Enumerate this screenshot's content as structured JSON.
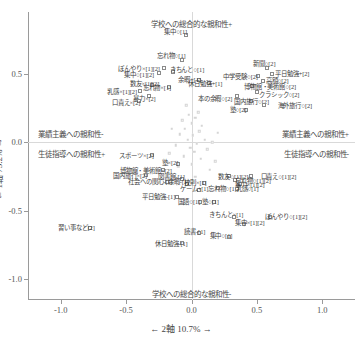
{
  "chart_data": {
    "type": "scatter",
    "title": "",
    "xlabel": "← 2軸 10.7% →",
    "ylabel": "← 1軸 75.2% →",
    "xlim": [
      -1.25,
      1.25
    ],
    "ylim": [
      -1.15,
      0.95
    ],
    "xticks": [
      "-1.0",
      "-0.5",
      "0.0",
      "0.5",
      "1.0"
    ],
    "xtickvals": [
      -1.0,
      -0.5,
      0.0,
      0.5,
      1.0
    ],
    "yticks": [
      "0.5",
      "0.0",
      "-0.5",
      "-1.0"
    ],
    "ytickvals": [
      0.5,
      0.0,
      -0.5,
      -1.0
    ],
    "grid": false,
    "legend": "none",
    "annotations": {
      "top": "学校への総合的な親和性+",
      "bottom": "学校への総合的な親和性-",
      "left_upper": "業績主義への親和性-",
      "left_lower": "生徒指導への親和性+",
      "right_upper": "業績主義への親和性+",
      "right_lower": "生徒指導への親和性-"
    },
    "points": [
      {
        "label": "集中○[1]",
        "x": -0.04,
        "y": 0.78,
        "lx": -0.12,
        "ly": 0.815
      },
      {
        "label": "忘れ物○[1]",
        "x": -0.07,
        "y": 0.6,
        "lx": -0.155,
        "ly": 0.635
      },
      {
        "label": "ぼんやり×[1][2]",
        "x": -0.21,
        "y": 0.545,
        "lx": -0.4,
        "ly": 0.545
      },
      {
        "label": "きちんと○[1]",
        "x": -0.145,
        "y": 0.515,
        "lx": -0.035,
        "ly": 0.535
      },
      {
        "label": "集中○[1][2]",
        "x": -0.245,
        "y": 0.505,
        "lx": -0.4,
        "ly": 0.5
      },
      {
        "label": "余暇+[1]",
        "x": 0.06,
        "y": 0.455,
        "lx": -0.015,
        "ly": 0.465
      },
      {
        "label": "休日勉強+[1]",
        "x": 0.13,
        "y": 0.43,
        "lx": 0.105,
        "ly": 0.43
      },
      {
        "label": "数友×[1][2]",
        "x": -0.3,
        "y": 0.42,
        "lx": -0.36,
        "ly": 0.435
      },
      {
        "label": "忘れ物×[1]",
        "x": -0.175,
        "y": 0.4,
        "lx": -0.265,
        "ly": 0.4
      },
      {
        "label": "乳感×[1][2]",
        "x": -0.39,
        "y": 0.375,
        "lx": -0.53,
        "ly": 0.375
      },
      {
        "label": "暴力×[2]",
        "x": -0.325,
        "y": 0.335,
        "lx": -0.36,
        "ly": 0.325
      },
      {
        "label": "口責え×[2]",
        "x": -0.4,
        "y": 0.3,
        "lx": -0.5,
        "ly": 0.295
      },
      {
        "label": "新聞○[2]",
        "x": 0.575,
        "y": 0.545,
        "lx": 0.555,
        "ly": 0.575
      },
      {
        "label": "平日勉強+[2]",
        "x": 0.615,
        "y": 0.5,
        "lx": 0.77,
        "ly": 0.505
      },
      {
        "label": "中学受験○[2]",
        "x": 0.505,
        "y": 0.48,
        "lx": 0.375,
        "ly": 0.485
      },
      {
        "label": "高額○[2]",
        "x": 0.545,
        "y": 0.445,
        "lx": 0.655,
        "ly": 0.455
      },
      {
        "label": "博物館・美術館○[2]",
        "x": 0.46,
        "y": 0.41,
        "lx": 0.6,
        "ly": 0.41
      },
      {
        "label": "クラシック○[2]",
        "x": 0.5,
        "y": 0.365,
        "lx": 0.67,
        "ly": 0.355
      },
      {
        "label": "本の余暇○[2]",
        "x": 0.345,
        "y": 0.34,
        "lx": 0.18,
        "ly": 0.325
      },
      {
        "label": "国内旅行○[2]",
        "x": 0.455,
        "y": 0.3,
        "lx": 0.46,
        "ly": 0.3
      },
      {
        "label": "海外旅行○[2]",
        "x": 0.555,
        "y": 0.275,
        "lx": 0.79,
        "ly": 0.275
      },
      {
        "label": "塾○[2]",
        "x": 0.42,
        "y": 0.235,
        "lx": 0.355,
        "ly": 0.245
      },
      {
        "label": "スポーツ×[2]",
        "x": -0.305,
        "y": -0.09,
        "lx": -0.42,
        "ly": -0.095
      },
      {
        "label": "塾×[2]",
        "x": -0.105,
        "y": -0.155,
        "lx": -0.165,
        "ly": -0.145
      },
      {
        "label": "博物館・美術館×[2]",
        "x": -0.215,
        "y": -0.2,
        "lx": -0.35,
        "ly": -0.2
      },
      {
        "label": "国内旅行×[2]",
        "x": -0.345,
        "y": -0.235,
        "lx": -0.47,
        "ly": -0.235
      },
      {
        "label": "図書館-[1]",
        "x": -0.075,
        "y": -0.265,
        "lx": -0.155,
        "ly": -0.245
      },
      {
        "label": "社会への関心-[1]",
        "x": -0.185,
        "y": -0.29,
        "lx": -0.315,
        "ly": -0.285
      },
      {
        "label": "余暇-[1]",
        "x": -0.035,
        "y": -0.305,
        "lx": -0.1,
        "ly": -0.285
      },
      {
        "label": "校則×[1]",
        "x": 0.095,
        "y": -0.3,
        "lx": 0.03,
        "ly": -0.29
      },
      {
        "label": "数友○[1][2]",
        "x": 0.285,
        "y": -0.245,
        "lx": 0.32,
        "ly": -0.245
      },
      {
        "label": "口責え○[1][2]",
        "x": 0.455,
        "y": -0.245,
        "lx": 0.665,
        "ly": -0.245
      },
      {
        "label": "忘れ物○[1][2]",
        "x": 0.335,
        "y": -0.275,
        "lx": 0.47,
        "ly": -0.275
      },
      {
        "label": "暴力×[1][2]",
        "x": 0.37,
        "y": -0.305,
        "lx": 0.445,
        "ly": -0.305
      },
      {
        "label": "ゲーム+[1]",
        "x": 0.055,
        "y": -0.345,
        "lx": 0.02,
        "ly": -0.335
      },
      {
        "label": "忘れ物○[1]",
        "x": 0.2,
        "y": -0.335,
        "lx": 0.235,
        "ly": -0.335
      },
      {
        "label": "乳感○[1]",
        "x": 0.345,
        "y": -0.34,
        "lx": 0.425,
        "ly": -0.335
      },
      {
        "label": "平日勉強-[1]",
        "x": -0.11,
        "y": -0.4,
        "lx": -0.25,
        "ly": -0.395
      },
      {
        "label": "国語○[1]",
        "x": 0.065,
        "y": -0.435,
        "lx": -0.02,
        "ly": -0.43
      },
      {
        "label": "塾○[1]",
        "x": 0.175,
        "y": -0.435,
        "lx": 0.145,
        "ly": -0.425
      },
      {
        "label": "きちんと×[1]",
        "x": 0.325,
        "y": -0.545,
        "lx": 0.265,
        "ly": -0.525
      },
      {
        "label": "ぼんやり○[1][2]",
        "x": 0.6,
        "y": -0.545,
        "lx": 0.725,
        "ly": -0.535
      },
      {
        "label": "集中×[1][2]",
        "x": 0.405,
        "y": -0.595,
        "lx": 0.445,
        "ly": -0.58
      },
      {
        "label": "習い事など[2]",
        "x": -0.775,
        "y": -0.625,
        "lx": -0.88,
        "ly": -0.62
      },
      {
        "label": "読書-[1]",
        "x": 0.055,
        "y": -0.665,
        "lx": 0.025,
        "ly": -0.65
      },
      {
        "label": "休日勉強-[1]",
        "x": -0.075,
        "y": -0.735,
        "lx": -0.155,
        "ly": -0.735
      },
      {
        "label": "集中○[1]",
        "x": 0.285,
        "y": -0.69,
        "lx": 0.225,
        "ly": -0.675
      }
    ],
    "cloud_points": [
      {
        "x": -0.02,
        "y": 0.2
      },
      {
        "x": 0.03,
        "y": 0.18
      },
      {
        "x": 0.0,
        "y": 0.14
      },
      {
        "x": -0.05,
        "y": 0.1
      },
      {
        "x": 0.06,
        "y": 0.08
      },
      {
        "x": 0.01,
        "y": 0.05
      },
      {
        "x": -0.03,
        "y": 0.02
      },
      {
        "x": 0.04,
        "y": -0.01
      },
      {
        "x": -0.01,
        "y": -0.04
      },
      {
        "x": 0.02,
        "y": -0.07
      },
      {
        "x": -0.06,
        "y": -0.1
      },
      {
        "x": 0.07,
        "y": -0.12
      },
      {
        "x": 0.0,
        "y": -0.16
      },
      {
        "x": -0.09,
        "y": 0.06
      },
      {
        "x": 0.1,
        "y": 0.02
      },
      {
        "x": 0.12,
        "y": -0.05
      },
      {
        "x": -0.12,
        "y": -0.02
      },
      {
        "x": 0.08,
        "y": 0.12
      },
      {
        "x": -0.07,
        "y": 0.16
      },
      {
        "x": 0.05,
        "y": 0.22
      },
      {
        "x": -0.1,
        "y": -0.18
      },
      {
        "x": 0.14,
        "y": -0.2
      },
      {
        "x": 0.16,
        "y": 0.0
      },
      {
        "x": -0.15,
        "y": 0.1
      },
      {
        "x": 0.03,
        "y": -0.25
      },
      {
        "x": -0.04,
        "y": 0.27
      },
      {
        "x": 0.09,
        "y": -0.3
      },
      {
        "x": 0.18,
        "y": -0.14
      },
      {
        "x": -0.17,
        "y": -0.08
      },
      {
        "x": 0.2,
        "y": 0.07
      }
    ]
  }
}
